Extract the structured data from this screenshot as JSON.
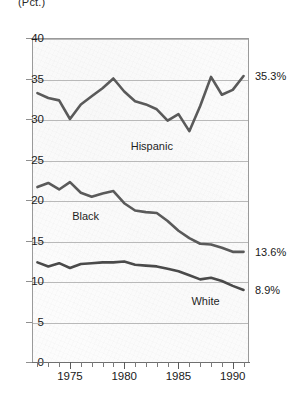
{
  "corner_note": "(Pct.)",
  "chart_data": {
    "type": "line",
    "title": "",
    "subtitle": "",
    "xlabel": "",
    "ylabel": "(Pct.)",
    "xlim": [
      1971.5,
      1991.5
    ],
    "ylim": [
      0,
      40
    ],
    "yticks": [
      0,
      5,
      10,
      15,
      20,
      25,
      30,
      35,
      40
    ],
    "ytick_labels": [
      "0",
      "5",
      "10",
      "15",
      "20",
      "25",
      "30",
      "35",
      "40"
    ],
    "xticks": [
      1972,
      1973,
      1974,
      1975,
      1976,
      1977,
      1978,
      1979,
      1980,
      1981,
      1982,
      1983,
      1984,
      1985,
      1986,
      1987,
      1988,
      1989,
      1990,
      1991
    ],
    "xtick_labels_shown": [
      "1975",
      "1980",
      "1985",
      "1990"
    ],
    "xtick_label_years": [
      1975,
      1980,
      1985,
      1990
    ],
    "grid": "horizontal",
    "legend": "inline-annotations",
    "x": [
      1972,
      1973,
      1974,
      1975,
      1976,
      1977,
      1978,
      1979,
      1980,
      1981,
      1982,
      1983,
      1984,
      1985,
      1986,
      1987,
      1988,
      1989,
      1990,
      1991
    ],
    "series": [
      {
        "name": "Hispanic",
        "color": "#5a5a5a",
        "label_x": 1980.6,
        "label_y": 27.4,
        "end_label": "35.3%",
        "values": [
          33.2,
          32.6,
          32.3,
          30.0,
          31.8,
          32.8,
          33.8,
          35.0,
          33.4,
          32.2,
          31.8,
          31.2,
          29.8,
          30.6,
          28.5,
          31.6,
          35.2,
          33.0,
          33.6,
          35.3
        ]
      },
      {
        "name": "Black",
        "color": "#5a5a5a",
        "label_x": 1975.2,
        "label_y": 18.8,
        "end_label": "13.6%",
        "values": [
          21.6,
          22.1,
          21.3,
          22.2,
          20.9,
          20.4,
          20.8,
          21.1,
          19.6,
          18.7,
          18.5,
          18.4,
          17.4,
          16.2,
          15.3,
          14.6,
          14.5,
          14.1,
          13.6,
          13.6
        ]
      },
      {
        "name": "White",
        "color": "#4a4a4a",
        "label_x": 1986.2,
        "label_y": 8.3,
        "end_label": "8.9%",
        "values": [
          12.3,
          11.8,
          12.2,
          11.6,
          12.1,
          12.2,
          12.3,
          12.3,
          12.4,
          12.0,
          11.9,
          11.8,
          11.5,
          11.2,
          10.7,
          10.2,
          10.4,
          10.0,
          9.4,
          8.9
        ]
      }
    ]
  },
  "axis": {
    "y_labels": [
      "40",
      "35",
      "30",
      "25",
      "20",
      "15",
      "10",
      "5",
      "0"
    ],
    "x_labels": [
      "1975",
      "1980",
      "1985",
      "1990"
    ]
  },
  "annotations": {
    "hispanic_label": "Hispanic",
    "black_label": "Black",
    "white_label": "White",
    "hispanic_end": "35.3%",
    "black_end": "13.6%",
    "white_end": "8.9%"
  },
  "colors": {
    "line": "#5a5a5a",
    "grid": "#b9b9b9",
    "axis": "#8f8f8f",
    "text": "#1a1a1a",
    "plot_bg": "#fcfcfc"
  }
}
